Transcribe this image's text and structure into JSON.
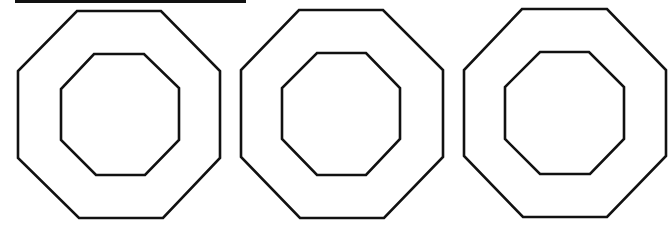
{
  "diagram": {
    "stroke_color": "#111111",
    "background": "#ffffff",
    "top_bar": {
      "x": 15,
      "y": 0,
      "width": 231,
      "height": 3,
      "color": "#111111"
    },
    "shapes": [
      {
        "name": "octagon-ring-1",
        "outer": [
          [
            77,
            11
          ],
          [
            161,
            11
          ],
          [
            220,
            71
          ],
          [
            220,
            158
          ],
          [
            163,
            218
          ],
          [
            79,
            218
          ],
          [
            18,
            158
          ],
          [
            18,
            71
          ]
        ],
        "inner": [
          [
            94,
            54
          ],
          [
            144,
            54
          ],
          [
            179,
            88
          ],
          [
            179,
            140
          ],
          [
            145,
            175
          ],
          [
            96,
            175
          ],
          [
            61,
            140
          ],
          [
            61,
            89
          ]
        ]
      },
      {
        "name": "octagon-ring-2",
        "outer": [
          [
            299,
            10
          ],
          [
            383,
            10
          ],
          [
            443,
            70
          ],
          [
            443,
            157
          ],
          [
            384,
            218
          ],
          [
            300,
            218
          ],
          [
            241,
            157
          ],
          [
            241,
            70
          ]
        ],
        "inner": [
          [
            317,
            53
          ],
          [
            366,
            53
          ],
          [
            400,
            88
          ],
          [
            400,
            139
          ],
          [
            366,
            175
          ],
          [
            317,
            175
          ],
          [
            282,
            139
          ],
          [
            282,
            88
          ]
        ]
      },
      {
        "name": "octagon-ring-3",
        "outer": [
          [
            522,
            9
          ],
          [
            607,
            9
          ],
          [
            666,
            70
          ],
          [
            666,
            156
          ],
          [
            607,
            217
          ],
          [
            523,
            217
          ],
          [
            464,
            156
          ],
          [
            464,
            70
          ]
        ],
        "inner": [
          [
            540,
            52
          ],
          [
            589,
            52
          ],
          [
            624,
            87
          ],
          [
            624,
            139
          ],
          [
            590,
            174
          ],
          [
            540,
            174
          ],
          [
            505,
            139
          ],
          [
            505,
            87
          ]
        ]
      }
    ]
  }
}
